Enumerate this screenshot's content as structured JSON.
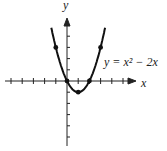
{
  "chart_data": {
    "type": "line",
    "title": "",
    "equation": "y = x^2 - 2x",
    "equation_label": "y = x² − 2x",
    "xlabel": "x",
    "ylabel": "y",
    "xlim": [
      -5,
      5
    ],
    "ylim": [
      -5,
      5
    ],
    "grid": false,
    "points": [
      {
        "x": -1,
        "y": 3
      },
      {
        "x": 0,
        "y": 0
      },
      {
        "x": 1,
        "y": -1
      },
      {
        "x": 2,
        "y": 0
      },
      {
        "x": 3,
        "y": 3
      }
    ],
    "series": [
      {
        "name": "y = x^2 - 2x",
        "function": "x^2 - 2x",
        "domain": [
          -1.4,
          3.4
        ]
      }
    ]
  },
  "labels": {
    "x_axis": "x",
    "y_axis": "y",
    "curve": "y = x² − 2x"
  }
}
